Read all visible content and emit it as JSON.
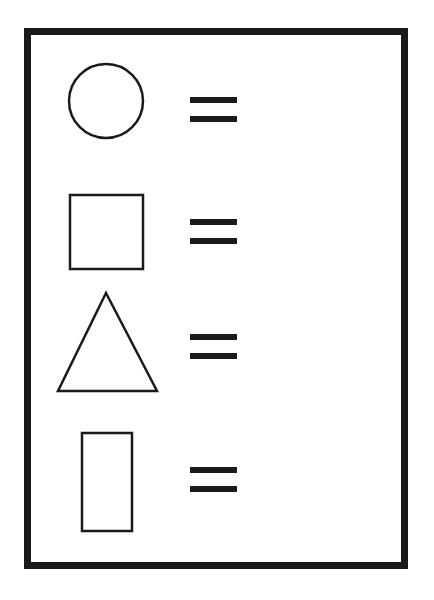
{
  "worksheet": {
    "rows": [
      {
        "shape": "circle",
        "relation": "equals",
        "answer": ""
      },
      {
        "shape": "square",
        "relation": "equals",
        "answer": ""
      },
      {
        "shape": "triangle",
        "relation": "equals",
        "answer": ""
      },
      {
        "shape": "rectangle",
        "relation": "equals",
        "answer": ""
      }
    ],
    "colors": {
      "ink": "#1a1a1a",
      "paper": "#ffffff"
    }
  }
}
